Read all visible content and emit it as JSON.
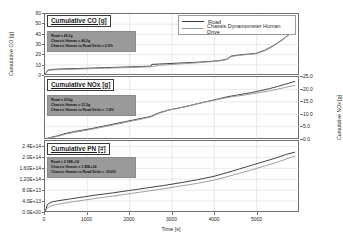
{
  "chart_data": {
    "type": "line",
    "title": "",
    "xlabel": "Time [s]",
    "xlim": [
      0,
      6000
    ],
    "xticks": [
      0,
      1000,
      2000,
      3000,
      4000,
      5000
    ],
    "xticklabels": [
      "0",
      "1000",
      "2000",
      "3000",
      "4000",
      "5000"
    ],
    "grid": true,
    "legend": {
      "position": "top-center",
      "entries": [
        {
          "name": "Road",
          "color": "#3a3a3a"
        },
        {
          "name": "Chassis Dynamometer Human Drive",
          "color": "#9a9a9a"
        }
      ]
    },
    "panels": [
      {
        "id": "co",
        "title": "Cumulative CO [g]",
        "ylabel": "Cumulative CO [g]",
        "ylabel_side": "left",
        "ylim": [
          0,
          60
        ],
        "yticks": [
          0,
          10,
          20,
          30,
          40,
          50,
          60
        ],
        "yticklabels": [
          "0",
          "10",
          "20",
          "30",
          "40",
          "50",
          "60"
        ],
        "annotation": {
          "road": "Road = 45.1g",
          "chassis": "Chassis Human = 46.2g",
          "delta": "Chassis Human to Road Delta = 2.5%"
        },
        "series": [
          {
            "name": "Road",
            "color": "#3a3a3a",
            "x": [
              0,
              60,
              150,
              300,
              500,
              800,
              1100,
              1400,
              1700,
              2000,
              2300,
              2500,
              2520,
              2700,
              3000,
              3300,
              3600,
              3900,
              4100,
              4300,
              4400,
              4600,
              4800,
              5000,
              5200,
              5400,
              5600,
              5800,
              5900
            ],
            "y": [
              0.2,
              4.6,
              5.4,
              5.8,
              6.1,
              6.4,
              6.8,
              7.2,
              7.6,
              8.0,
              8.4,
              8.7,
              10.4,
              10.8,
              11.4,
              12.0,
              12.6,
              13.4,
              14.0,
              15.6,
              18.6,
              19.8,
              20.6,
              21.4,
              24.5,
              29.0,
              34.5,
              41.0,
              44.0
            ]
          },
          {
            "name": "Chassis Dynamometer Human Drive",
            "color": "#9a9a9a",
            "x": [
              0,
              60,
              150,
              300,
              500,
              800,
              1100,
              1400,
              1700,
              2000,
              2300,
              2500,
              2700,
              3000,
              3300,
              3600,
              3900,
              4100,
              4300,
              4400,
              4600,
              4800,
              5000,
              5200,
              5400,
              5600,
              5800,
              5900
            ],
            "y": [
              0.2,
              4.2,
              4.9,
              5.2,
              5.5,
              5.8,
              6.2,
              6.6,
              7.0,
              7.4,
              7.8,
              8.1,
              9.6,
              10.4,
              11.2,
              12.0,
              13.0,
              13.7,
              15.2,
              18.2,
              19.4,
              20.2,
              21.0,
              24.0,
              28.6,
              34.2,
              40.8,
              44.2
            ]
          }
        ]
      },
      {
        "id": "nox",
        "title": "Cumulative NOx [g]",
        "ylabel": "Cumulative NOx [g]",
        "ylabel_side": "right",
        "ylim": [
          0,
          25
        ],
        "yticks": [
          0.0,
          5.0,
          10.0,
          15.0,
          20.0,
          25.0
        ],
        "yticklabels": [
          "0.0",
          "5.0",
          "10.0",
          "15.0",
          "20.0",
          "25.0"
        ],
        "annotation": {
          "road": "Road = 23.0g",
          "chassis": "Chassis Human = 21.3g",
          "delta": "Chassis Human to Road Delta = -7.4%"
        },
        "series": [
          {
            "name": "Road",
            "color": "#3a3a3a",
            "x": [
              0,
              100,
              300,
              500,
              700,
              900,
              1100,
              1300,
              1500,
              1700,
              1900,
              2100,
              2300,
              2500,
              2700,
              2900,
              3100,
              3300,
              3500,
              3700,
              3900,
              4100,
              4300,
              4500,
              4700,
              4900,
              5100,
              5300,
              5500,
              5700,
              5900
            ],
            "y": [
              0.0,
              0.5,
              1.3,
              2.3,
              3.0,
              3.6,
              4.2,
              4.9,
              5.6,
              6.3,
              7.0,
              7.7,
              8.4,
              9.1,
              10.6,
              11.6,
              12.3,
              13.0,
              13.8,
              14.6,
              15.4,
              16.2,
              17.0,
              17.6,
              18.2,
              18.8,
              19.5,
              20.3,
              21.2,
              22.2,
              23.2
            ]
          },
          {
            "name": "Chassis Dynamometer Human Drive",
            "color": "#9a9a9a",
            "x": [
              0,
              100,
              300,
              500,
              700,
              900,
              1100,
              1300,
              1500,
              1700,
              1900,
              2100,
              2300,
              2500,
              2700,
              2900,
              3100,
              3300,
              3500,
              3700,
              3900,
              4100,
              4300,
              4500,
              4700,
              4900,
              5100,
              5300,
              5500,
              5700,
              5900
            ],
            "y": [
              0.0,
              0.4,
              1.1,
              2.0,
              2.7,
              3.3,
              3.9,
              4.6,
              5.3,
              6.0,
              6.7,
              7.4,
              8.1,
              8.9,
              10.4,
              11.5,
              12.3,
              13.0,
              13.8,
              14.6,
              15.3,
              16.0,
              16.7,
              17.2,
              17.7,
              18.2,
              18.8,
              19.4,
              20.1,
              20.9,
              21.6
            ]
          }
        ]
      },
      {
        "id": "pn",
        "title": "Cumulative PN [#]",
        "ylabel": "",
        "ylabel_side": "left",
        "ylim": [
          0,
          260000000000000
        ],
        "yticks": [
          0,
          40000000000000,
          80000000000000,
          120000000000000,
          160000000000000,
          200000000000000,
          240000000000000
        ],
        "yticklabels": [
          "0.0E+00",
          "4.0E+13",
          "8.0E+13",
          "1.20E+14",
          "1.60E+14",
          "2.0E+14",
          "2.4E+14"
        ],
        "annotation": {
          "road": "Road = 2.18E+14",
          "chassis": "Chassis Human = 1.95E+14",
          "delta": "Chassis Human to Road Delta = -10.6%"
        },
        "series": [
          {
            "name": "Road",
            "color": "#3a3a3a",
            "x": [
              0,
              60,
              150,
              300,
              600,
              900,
              1200,
              1600,
              2000,
              2400,
              2800,
              3200,
              3600,
              4000,
              4300,
              4600,
              4900,
              5200,
              5500,
              5700,
              5900
            ],
            "y": [
              0,
              28000000000000,
              36000000000000,
              41000000000000,
              48000000000000,
              55000000000000,
              62000000000000,
              70000000000000,
              79000000000000,
              88000000000000,
              97000000000000,
              107000000000000,
              118000000000000,
              131000000000000,
              144000000000000,
              158000000000000,
              172000000000000,
              186000000000000,
              200000000000000,
              211000000000000,
              219000000000000
            ]
          },
          {
            "name": "Chassis Dynamometer Human Drive",
            "color": "#9a9a9a",
            "x": [
              0,
              60,
              150,
              300,
              600,
              900,
              1200,
              1600,
              2000,
              2400,
              2800,
              3200,
              3600,
              4000,
              4300,
              4600,
              4900,
              5200,
              5500,
              5700,
              5900
            ],
            "y": [
              0,
              16000000000000,
              23000000000000,
              28000000000000,
              36000000000000,
              43000000000000,
              50000000000000,
              58000000000000,
              67000000000000,
              76000000000000,
              85000000000000,
              95000000000000,
              105000000000000,
              117000000000000,
              129000000000000,
              142000000000000,
              155000000000000,
              169000000000000,
              183000000000000,
              194000000000000,
              205000000000000
            ]
          }
        ]
      }
    ]
  }
}
